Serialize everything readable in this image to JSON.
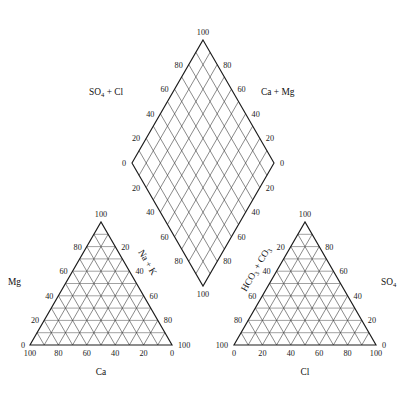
{
  "figure": {
    "caption": ""
  },
  "chart_data": {
    "type": "scatter",
    "subtitle": "",
    "grid": true,
    "legend_position": "none",
    "annotations": [],
    "series": [],
    "panels": [
      {
        "id": "cation-triangle",
        "name": "Cation triangle",
        "shape": "ternary",
        "axes": [
          {
            "id": "cation-left-axis",
            "label": "Mg",
            "label_sub": "",
            "position": "left",
            "range": [
              0,
              100
            ],
            "tick_step": 20,
            "ticks": [
              "0",
              "20",
              "40",
              "60",
              "80",
              "100"
            ],
            "direction": "bottom-to-top"
          },
          {
            "id": "cation-bottom-axis",
            "label": "Ca",
            "label_sub": "",
            "position": "bottom",
            "range": [
              0,
              100
            ],
            "tick_step": 20,
            "ticks": [
              "100",
              "80",
              "60",
              "40",
              "20",
              "0"
            ],
            "direction": "left-to-right-descending"
          },
          {
            "id": "cation-right-axis",
            "label": "Na + K",
            "label_sub": "",
            "position": "right",
            "range": [
              0,
              100
            ],
            "tick_step": 20,
            "ticks": [
              "20",
              "40",
              "60",
              "80",
              "100"
            ],
            "direction": "top-to-bottom"
          }
        ],
        "divisions": 10,
        "points": []
      },
      {
        "id": "anion-triangle",
        "name": "Anion triangle",
        "shape": "ternary",
        "axes": [
          {
            "id": "anion-left-axis",
            "label": "HCO3 + CO3",
            "label_main": "HCO",
            "label_sub": "3",
            "label_main2": "CO",
            "label_sub2": "3",
            "position": "left",
            "range": [
              0,
              100
            ],
            "tick_step": 20,
            "ticks": [
              "20",
              "40",
              "60",
              "80",
              "100"
            ],
            "direction": "top-to-bottom"
          },
          {
            "id": "anion-bottom-axis",
            "label": "Cl",
            "label_sub": "",
            "position": "bottom",
            "range": [
              0,
              100
            ],
            "tick_step": 20,
            "ticks": [
              "0",
              "20",
              "40",
              "60",
              "80",
              "100"
            ],
            "direction": "left-to-right-ascending"
          },
          {
            "id": "anion-right-axis",
            "label": "SO4",
            "label_main": "SO",
            "label_sub": "4",
            "position": "right",
            "range": [
              0,
              100
            ],
            "tick_step": 20,
            "ticks": [
              "0",
              "20",
              "40",
              "60",
              "80",
              "100"
            ],
            "direction": "bottom-to-top"
          }
        ],
        "divisions": 10,
        "points": []
      },
      {
        "id": "diamond-field",
        "name": "Diamond field",
        "shape": "diamond",
        "axes": [
          {
            "id": "diamond-upper-left-axis",
            "label": "SO4 + Cl",
            "label_main": "SO",
            "label_sub": "4",
            "label_tail": "+ Cl",
            "position": "upper-left",
            "range": [
              0,
              100
            ],
            "tick_step": 20,
            "ticks": [
              "0",
              "20",
              "40",
              "60",
              "80",
              "100"
            ],
            "direction": "bottom-left-to-apex"
          },
          {
            "id": "diamond-upper-right-axis",
            "label": "Ca + Mg",
            "label_main": "Ca",
            "label_sub": "",
            "label_tail": "+ Mg",
            "position": "upper-right",
            "range": [
              0,
              100
            ],
            "tick_step": 20,
            "ticks": [
              "0",
              "20",
              "40",
              "60",
              "80",
              "100"
            ],
            "direction": "bottom-right-to-apex"
          },
          {
            "id": "diamond-lower-left-axis",
            "label": "",
            "position": "lower-left",
            "range": [
              0,
              100
            ],
            "tick_step": 20,
            "ticks": [
              "20",
              "40",
              "60",
              "80",
              "100"
            ],
            "direction": "left-vertex-to-bottom"
          },
          {
            "id": "diamond-lower-right-axis",
            "label": "",
            "position": "lower-right",
            "range": [
              0,
              100
            ],
            "tick_step": 20,
            "ticks": [
              "20",
              "40",
              "60",
              "80",
              "100"
            ],
            "direction": "right-vertex-to-bottom"
          }
        ],
        "divisions": 10,
        "apex_label": "100",
        "bottom_label": "100",
        "left_vertex_label": "0",
        "right_vertex_label": "0",
        "points": []
      }
    ]
  },
  "labels": {
    "diamond_left_title_main": "SO",
    "diamond_left_title_sub": "4",
    "diamond_left_title_tail": " + Cl",
    "diamond_right_title": "Ca  +  Mg",
    "cation_left_title": "Mg",
    "cation_bottom_title": "Ca",
    "cation_right_title": "Na + K",
    "anion_bottom_title": "Cl",
    "anion_right_title_main": "SO",
    "anion_right_title_sub": "4",
    "anion_left_title_main": "HCO",
    "anion_left_title_sub": "3",
    "anion_left_title_mid": " + CO",
    "anion_left_title_sub2": "3"
  },
  "ticks": {
    "t0": "0",
    "t20": "20",
    "t40": "40",
    "t60": "60",
    "t80": "80",
    "t100": "100"
  }
}
